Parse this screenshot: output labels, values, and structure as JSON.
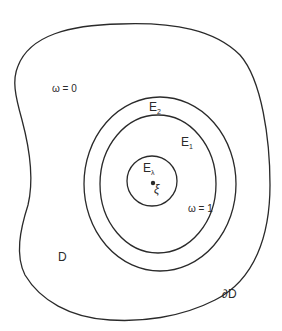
{
  "diagram": {
    "regions": {
      "outer_domain": {
        "label": "D",
        "boundary_label": "∂D"
      },
      "outer_ring": {
        "label_main": "E",
        "label_sub": "2"
      },
      "middle_ring": {
        "label_main": "E",
        "label_sub": "1"
      },
      "inner_disc": {
        "label_main": "E",
        "label_sub": "λ"
      }
    },
    "point": {
      "label": "ξ"
    },
    "annotations": {
      "omega_zero": "ω = 0",
      "omega_one": "ω = 1"
    },
    "colors": {
      "stroke": "#2a2a2a",
      "background": "#ffffff"
    }
  }
}
